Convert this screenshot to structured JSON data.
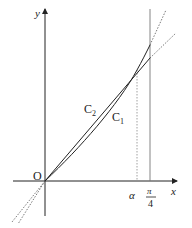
{
  "diagram": {
    "axes": {
      "x_label": "x",
      "y_label": "y",
      "origin_label": "O"
    },
    "curves": [
      {
        "name": "C1",
        "label": "C",
        "subscript": "1",
        "description": "curve (convex) through O and intersection point"
      },
      {
        "name": "C2",
        "label": "C",
        "subscript": "2",
        "description": "straight line through O and intersection point"
      }
    ],
    "x_marks": {
      "alpha": "α",
      "pi_over_4_num": "π",
      "pi_over_4_den": "4"
    },
    "colors": {
      "ink": "#222222",
      "guide": "#888888",
      "background": "#ffffff"
    }
  }
}
